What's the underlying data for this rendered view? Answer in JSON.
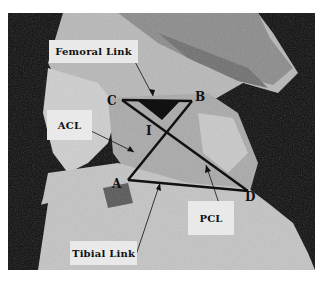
{
  "figure": {
    "labels": {
      "femoral_link": "Femoral Link",
      "acl": "ACL",
      "tibial_link": "Tibial Link",
      "pcl": "PCL"
    },
    "points": {
      "A": "A",
      "B": "B",
      "C": "C",
      "D": "D",
      "I": "I"
    },
    "linkage": {
      "C": [
        122,
        100
      ],
      "B": [
        192,
        101
      ],
      "A": [
        128,
        180
      ],
      "D": [
        248,
        191
      ],
      "line_color": "#111111"
    }
  }
}
